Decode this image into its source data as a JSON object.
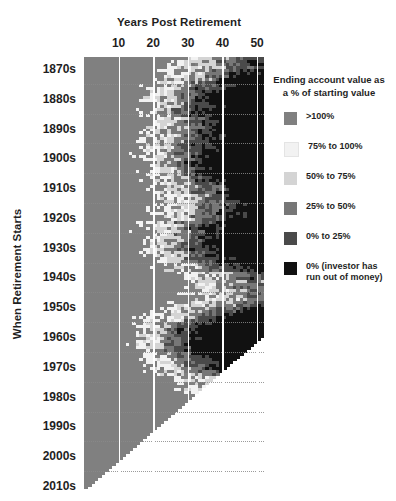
{
  "chart_data": {
    "type": "heatmap",
    "title": "",
    "xlabel": "Years Post Retirement",
    "ylabel": "When Retirement Starts",
    "xticks": [
      10,
      20,
      30,
      40,
      50
    ],
    "xlim": [
      0,
      52
    ],
    "grid": true,
    "legend_position": "right",
    "legend_title": "Ending account value as a % of starting value",
    "legend_entries": [
      {
        "label": ">100%",
        "color": "#808080",
        "min": 100,
        "max": null
      },
      {
        "label": "75% to 100%",
        "color": "#f2f2f2",
        "min": 75,
        "max": 100
      },
      {
        "label": "50% to 75%",
        "color": "#d4d4d4",
        "min": 50,
        "max": 75
      },
      {
        "label": "25% to 50%",
        "color": "#777777",
        "min": 25,
        "max": 50
      },
      {
        "label": "0% to 25%",
        "color": "#4a4a4a",
        "min": 0,
        "max": 25
      },
      {
        "label": "0% (investor has\nrun out of money)",
        "color": "#111111",
        "min": 0,
        "max": 0
      }
    ],
    "y_categories": [
      "1870s",
      "1880s",
      "1890s",
      "1900s",
      "1910s",
      "1920s",
      "1930s",
      "1940s",
      "1950s",
      "1960s",
      "1970s",
      "1980s",
      "1990s",
      "2000s",
      "2010s"
    ],
    "y_start_year": 1871,
    "y_end_year": 2015,
    "x_start": 1,
    "x_max": 52
  },
  "axes": {
    "x_title": "Years Post Retirement",
    "y_title": "When Retirement Starts"
  },
  "legend": {
    "title_line1": "Ending account value as",
    "title_line2": "a % of starting value"
  }
}
